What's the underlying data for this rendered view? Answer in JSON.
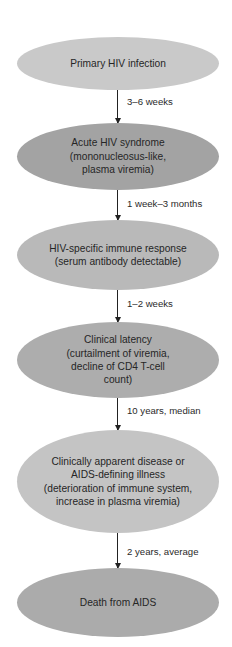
{
  "diagram": {
    "type": "flowchart",
    "direction": "top-to-bottom",
    "nodes": [
      {
        "id": "n1",
        "lines": [
          "Primary HIV infection"
        ],
        "fill": "#c9c9c9"
      },
      {
        "id": "n2",
        "lines": [
          "Acute HIV syndrome",
          "(mononucleosus-like,",
          "plasma viremia)"
        ],
        "fill": "#a3a3a3"
      },
      {
        "id": "n3",
        "lines": [
          "HIV-specific immune response",
          "(serum antibody detectable)"
        ],
        "fill": "#b9b9b9"
      },
      {
        "id": "n4",
        "lines": [
          "Clinical latency",
          "(curtailment of viremia,",
          "decline of CD4 T-cell",
          "count)"
        ],
        "fill": "#adadad"
      },
      {
        "id": "n5",
        "lines": [
          "Clinically apparent disease or",
          "AIDS-defining illness",
          "(deterioration of immune system,",
          "increase in plasma viremia)"
        ],
        "fill": "#c4c4c4"
      },
      {
        "id": "n6",
        "lines": [
          "Death from AIDS"
        ],
        "fill": "#ababab"
      }
    ],
    "edges": [
      {
        "from": "n1",
        "to": "n2",
        "label": "3–6 weeks"
      },
      {
        "from": "n2",
        "to": "n3",
        "label": "1 week–3 months"
      },
      {
        "from": "n3",
        "to": "n4",
        "label": "1–2 weeks"
      },
      {
        "from": "n4",
        "to": "n5",
        "label": "10 years, median"
      },
      {
        "from": "n5",
        "to": "n6",
        "label": "2 years, average"
      }
    ]
  }
}
